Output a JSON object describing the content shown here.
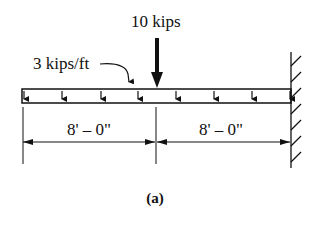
{
  "figure": {
    "caption": "(a)",
    "type": "cantilever-beam-loading"
  },
  "loads": {
    "distributed": {
      "label": "3 kips/ft",
      "magnitude": 3,
      "unit": "kips/ft"
    },
    "point": {
      "label": "10 kips",
      "magnitude": 10,
      "unit": "kips"
    }
  },
  "dimensions": [
    {
      "label": "8' – 0\"",
      "length_ft": 8
    },
    {
      "label": "8' – 0\"",
      "length_ft": 8
    }
  ],
  "support": {
    "type": "fixed-wall",
    "side": "right"
  },
  "colors": {
    "ink": "#111111",
    "background": "#ffffff"
  }
}
